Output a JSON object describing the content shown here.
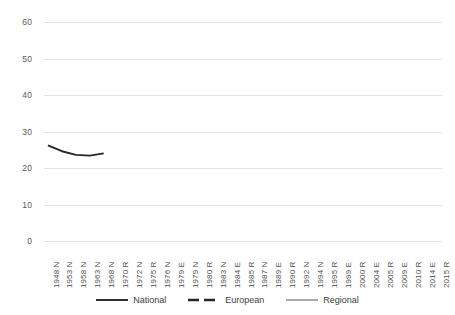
{
  "chart_data": {
    "type": "line",
    "title": "",
    "subtitle": "",
    "xlabel": "",
    "ylabel": "",
    "ylim": [
      0,
      60
    ],
    "ytick_step": 10,
    "yticks": [
      0,
      10,
      20,
      30,
      40,
      50,
      60
    ],
    "grid": true,
    "legend_position": "bottom",
    "categories": [
      "1948 N",
      "1953 N",
      "1958 N",
      "1963 N",
      "1968 N",
      "1970 R",
      "1972 N",
      "1975 R",
      "1976 N",
      "1979 E",
      "1979 N",
      "1980 R",
      "1983 N",
      "1984 E",
      "1985 R",
      "1987 N",
      "1989 E",
      "1990 R",
      "1992 N",
      "1994 N",
      "1995 R",
      "1999 E",
      "2000 R",
      "2004 E",
      "2005 R",
      "2009 E",
      "2010 R",
      "2014 E",
      "2015 R"
    ],
    "series": [
      {
        "name": "National",
        "color": "#262626",
        "style": "solid",
        "values": [
          26.2,
          24.6,
          23.6,
          23.4,
          24.0,
          null,
          24.9,
          null,
          22.2,
          null,
          21.8,
          null,
          21.2,
          null,
          null,
          23.7,
          null,
          null,
          11.0,
          null,
          null,
          null,
          null,
          null,
          null,
          null,
          null,
          null,
          null
        ]
      },
      {
        "name": "European",
        "color": "#262626",
        "style": "dashed",
        "values": [
          null,
          null,
          null,
          null,
          null,
          null,
          null,
          null,
          null,
          34.8,
          null,
          null,
          null,
          28.3,
          null,
          null,
          31.8,
          null,
          null,
          null,
          null,
          26.4,
          null,
          23.2,
          null,
          19.7,
          null,
          16.3,
          null
        ]
      },
      {
        "name": "Regional",
        "color": "#a6a6a6",
        "style": "solid",
        "values": [
          null,
          null,
          null,
          null,
          null,
          22.4,
          null,
          25.3,
          null,
          null,
          null,
          25.3,
          null,
          null,
          27.7,
          null,
          null,
          28.5,
          null,
          null,
          25.9,
          null,
          44.8,
          null,
          51.3,
          null,
          44.0,
          null,
          27.0
        ]
      }
    ],
    "legend": [
      {
        "label": "National",
        "color": "#262626",
        "style": "solid"
      },
      {
        "label": "European",
        "color": "#262626",
        "style": "dashed"
      },
      {
        "label": "Regional",
        "color": "#a6a6a6",
        "style": "solid"
      }
    ]
  }
}
